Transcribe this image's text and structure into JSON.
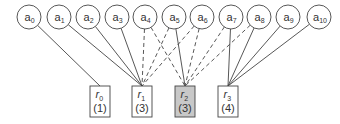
{
  "diagram": {
    "type": "bipartite-assignment-graph",
    "top_nodes": [
      {
        "id": "a0",
        "base": "a",
        "sub": "0",
        "x": 29
      },
      {
        "id": "a1",
        "base": "a",
        "sub": "1",
        "x": 59
      },
      {
        "id": "a2",
        "base": "a",
        "sub": "2",
        "x": 88
      },
      {
        "id": "a3",
        "base": "a",
        "sub": "3",
        "x": 117
      },
      {
        "id": "a4",
        "base": "a",
        "sub": "4",
        "x": 145
      },
      {
        "id": "a5",
        "base": "a",
        "sub": "5",
        "x": 174
      },
      {
        "id": "a6",
        "base": "a",
        "sub": "6",
        "x": 202
      },
      {
        "id": "a7",
        "base": "a",
        "sub": "7",
        "x": 231
      },
      {
        "id": "a8",
        "base": "a",
        "sub": "8",
        "x": 259
      },
      {
        "id": "a9",
        "base": "a",
        "sub": "9",
        "x": 288
      },
      {
        "id": "a10",
        "base": "a",
        "sub": "10",
        "x": 319
      }
    ],
    "bottom_nodes": [
      {
        "id": "r0",
        "base": "r",
        "sub": "0",
        "count": "(1)",
        "x": 100,
        "highlighted": false
      },
      {
        "id": "r1",
        "base": "r",
        "sub": "1",
        "count": "(3)",
        "x": 142,
        "highlighted": false
      },
      {
        "id": "r2",
        "base": "r",
        "sub": "2",
        "count": "(3)",
        "x": 185,
        "highlighted": true
      },
      {
        "id": "r3",
        "base": "r",
        "sub": "3",
        "count": "(4)",
        "x": 228,
        "highlighted": false
      }
    ],
    "edges": [
      {
        "from": "a0",
        "to": "r0",
        "style": "solid"
      },
      {
        "from": "a1",
        "to": "r1",
        "style": "solid"
      },
      {
        "from": "a2",
        "to": "r1",
        "style": "solid"
      },
      {
        "from": "a3",
        "to": "r1",
        "style": "solid"
      },
      {
        "from": "a4",
        "to": "r1",
        "style": "dashed"
      },
      {
        "from": "a4",
        "to": "r2",
        "style": "dashed"
      },
      {
        "from": "a5",
        "to": "r1",
        "style": "dashed"
      },
      {
        "from": "a5",
        "to": "r2",
        "style": "solid"
      },
      {
        "from": "a6",
        "to": "r1",
        "style": "dashed"
      },
      {
        "from": "a6",
        "to": "r2",
        "style": "dashed"
      },
      {
        "from": "a7",
        "to": "r2",
        "style": "dashed"
      },
      {
        "from": "a7",
        "to": "r3",
        "style": "solid"
      },
      {
        "from": "a8",
        "to": "r2",
        "style": "dashed"
      },
      {
        "from": "a8",
        "to": "r3",
        "style": "solid"
      },
      {
        "from": "a9",
        "to": "r3",
        "style": "solid"
      },
      {
        "from": "a10",
        "to": "r3",
        "style": "solid"
      }
    ],
    "colors": {
      "stroke": "#444444",
      "highlight_fill": "#c8c8c8",
      "node_fill": "#ffffff"
    }
  }
}
